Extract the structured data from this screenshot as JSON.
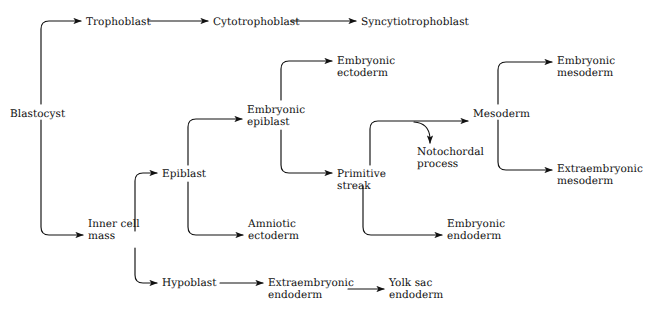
{
  "figure": {
    "caption_fragment": "",
    "background_color": "#ffffff",
    "line_color": "#111111",
    "text_color": "#111111"
  },
  "nodes": [
    {
      "id": "blastocyst",
      "label": "Blastocyst",
      "x": 10,
      "y": 108,
      "align": "left"
    },
    {
      "id": "trophoblast",
      "label": "Trophoblast",
      "x": 86,
      "y": 16,
      "align": "left"
    },
    {
      "id": "cytotrophoblast",
      "label": "Cytotrophoblast",
      "x": 213,
      "y": 16,
      "align": "left"
    },
    {
      "id": "syncytiotrophoblast",
      "label": "Syncytiotrophoblast",
      "x": 361,
      "y": 16,
      "align": "left"
    },
    {
      "id": "inner-cell-mass",
      "label": "Inner cell\nmass",
      "x": 88,
      "y": 218,
      "align": "left"
    },
    {
      "id": "epiblast",
      "label": "Epiblast",
      "x": 162,
      "y": 168,
      "align": "left"
    },
    {
      "id": "hypoblast",
      "label": "Hypoblast",
      "x": 162,
      "y": 277,
      "align": "left"
    },
    {
      "id": "embryonic-epiblast",
      "label": "Embryonic\nepiblast",
      "x": 247,
      "y": 104,
      "align": "left"
    },
    {
      "id": "amniotic-ectoderm",
      "label": "Amniotic\nectoderm",
      "x": 248,
      "y": 218,
      "align": "left"
    },
    {
      "id": "extraembryonic-endoderm",
      "label": "Extraembryonic\nendoderm",
      "x": 268,
      "y": 277,
      "align": "left"
    },
    {
      "id": "embryonic-ectoderm",
      "label": "Embryonic\nectoderm",
      "x": 337,
      "y": 55,
      "align": "left"
    },
    {
      "id": "primitive-streak",
      "label": "Primitive\nstreak",
      "x": 337,
      "y": 168,
      "align": "left"
    },
    {
      "id": "yolk-sac-endoderm",
      "label": "Yolk sac\nendoderm",
      "x": 389,
      "y": 277,
      "align": "left"
    },
    {
      "id": "notochordal-process",
      "label": "Notochordal\nprocess",
      "x": 417,
      "y": 146,
      "align": "left"
    },
    {
      "id": "embryonic-endoderm",
      "label": "Embryonic\nendoderm",
      "x": 447,
      "y": 218,
      "align": "left"
    },
    {
      "id": "mesoderm",
      "label": "Mesoderm",
      "x": 473,
      "y": 108,
      "align": "left"
    },
    {
      "id": "embryonic-mesoderm",
      "label": "Embryonic\nmesoderm",
      "x": 557,
      "y": 55,
      "align": "left"
    },
    {
      "id": "extraembryonic-mesoderm",
      "label": "Extraembryonic\nmesoderm",
      "x": 557,
      "y": 163,
      "align": "left"
    }
  ],
  "edges": [
    {
      "id": "blastocyst-to-trophoblast",
      "from": "blastocyst",
      "to": "trophoblast",
      "shape": "elbow-up"
    },
    {
      "id": "blastocyst-to-inner-cell-mass",
      "from": "blastocyst",
      "to": "inner-cell-mass",
      "shape": "elbow-down"
    },
    {
      "id": "trophoblast-to-cytotrophoblast",
      "from": "trophoblast",
      "to": "cytotrophoblast",
      "shape": "straight"
    },
    {
      "id": "cytotrophoblast-to-syncytiotrophoblast",
      "from": "cytotrophoblast",
      "to": "syncytiotrophoblast",
      "shape": "straight"
    },
    {
      "id": "inner-cell-mass-to-epiblast",
      "from": "inner-cell-mass",
      "to": "epiblast",
      "shape": "elbow-up"
    },
    {
      "id": "inner-cell-mass-to-hypoblast",
      "from": "inner-cell-mass",
      "to": "hypoblast",
      "shape": "elbow-down"
    },
    {
      "id": "epiblast-to-embryonic-epiblast",
      "from": "epiblast",
      "to": "embryonic-epiblast",
      "shape": "elbow-up"
    },
    {
      "id": "epiblast-to-amniotic-ectoderm",
      "from": "epiblast",
      "to": "amniotic-ectoderm",
      "shape": "elbow-down"
    },
    {
      "id": "hypoblast-to-extraembryonic-endoderm",
      "from": "hypoblast",
      "to": "extraembryonic-endoderm",
      "shape": "straight"
    },
    {
      "id": "extraembryonic-endoderm-to-yolk-sac",
      "from": "extraembryonic-endoderm",
      "to": "yolk-sac-endoderm",
      "shape": "straight"
    },
    {
      "id": "embryonic-epiblast-to-embryonic-ectoderm",
      "from": "embryonic-epiblast",
      "to": "embryonic-ectoderm",
      "shape": "elbow-up"
    },
    {
      "id": "embryonic-epiblast-to-primitive-streak",
      "from": "embryonic-epiblast",
      "to": "primitive-streak",
      "shape": "elbow-down"
    },
    {
      "id": "primitive-streak-to-mesoderm",
      "from": "primitive-streak",
      "to": "mesoderm",
      "shape": "elbow-up"
    },
    {
      "id": "primitive-streak-to-notochordal-process",
      "from": "primitive-streak",
      "to": "notochordal-process",
      "shape": "branch-down"
    },
    {
      "id": "primitive-streak-to-embryonic-endoderm",
      "from": "primitive-streak",
      "to": "embryonic-endoderm",
      "shape": "elbow-down"
    },
    {
      "id": "mesoderm-to-embryonic-mesoderm",
      "from": "mesoderm",
      "to": "embryonic-mesoderm",
      "shape": "elbow-up"
    },
    {
      "id": "mesoderm-to-extraembryonic-mesoderm",
      "from": "mesoderm",
      "to": "extraembryonic-mesoderm",
      "shape": "elbow-down"
    }
  ]
}
